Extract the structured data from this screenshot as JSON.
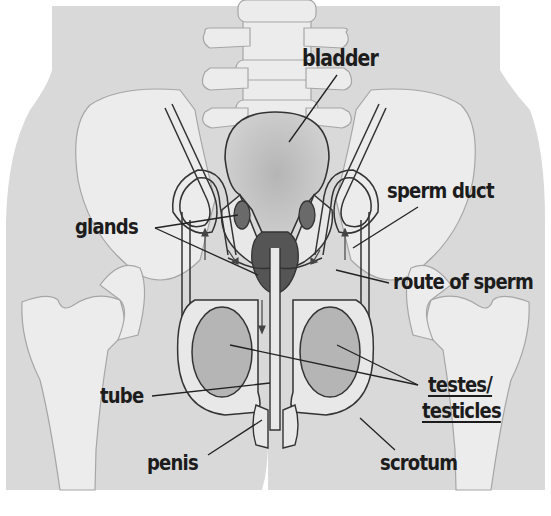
{
  "diagram": {
    "colors": {
      "body_fill": "#d9d9d9",
      "bone_fill": "#ececec",
      "bone_stroke": "#a6a6a6",
      "organ_stroke": "#333333",
      "bladder_fill": "#c4c4c4",
      "gland_fill": "#6a6a6a",
      "prostate_fill": "#555555",
      "testis_fill": "#b5b5b5",
      "duct_fill": "#e8e8e8",
      "label_color": "#1c1c1c"
    },
    "labels": [
      {
        "id": "bladder",
        "text": "bladder",
        "underlined": false
      },
      {
        "id": "glands",
        "text": "glands",
        "underlined": false
      },
      {
        "id": "sperm-duct",
        "text": "sperm duct",
        "underlined": false
      },
      {
        "id": "route-of-sperm",
        "text": "route of sperm",
        "underlined": false
      },
      {
        "id": "testes",
        "text": "testes/",
        "underlined": true
      },
      {
        "id": "testicles",
        "text": "testicles",
        "underlined": true
      },
      {
        "id": "tube",
        "text": "tube",
        "underlined": false
      },
      {
        "id": "penis",
        "text": "penis",
        "underlined": false
      },
      {
        "id": "scrotum",
        "text": "scrotum",
        "underlined": false
      }
    ]
  }
}
